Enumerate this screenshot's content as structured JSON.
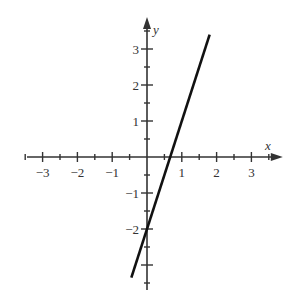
{
  "chart_data": {
    "type": "line",
    "title": "",
    "xlabel": "x",
    "ylabel": "y",
    "xlim": [
      -3.5,
      3.5
    ],
    "ylim": [
      -3.5,
      3.5
    ],
    "x_ticks": [
      -3,
      -2,
      -1,
      1,
      2,
      3
    ],
    "y_ticks": [
      3,
      2,
      1,
      -1,
      -2
    ],
    "x_tick_labels": [
      "−3",
      "−2",
      "−1",
      "1",
      "2",
      "3"
    ],
    "y_tick_labels": [
      "3",
      "2",
      "1",
      "−1",
      "−2"
    ],
    "minor_tick_step": 0.5,
    "grid": false,
    "series": [
      {
        "name": "y = 3x - 2",
        "slope": 3,
        "intercept": -2,
        "x": [
          -0.45,
          1.8
        ],
        "y": [
          -3.35,
          3.4
        ],
        "color": "#111111"
      }
    ]
  },
  "colors": {
    "axis": "#333333",
    "line": "#111111",
    "background": "#ffffff"
  }
}
